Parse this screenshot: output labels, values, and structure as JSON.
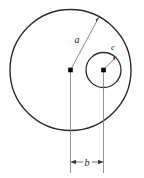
{
  "diagram": {
    "background_color": "#ffffff",
    "stroke_color": "#2b2b2b",
    "thin_stroke_color": "#555555",
    "marker_color": "#000000",
    "labels": {
      "outer_radius": "a",
      "center_offset": "b",
      "inner_radius": "c"
    },
    "shapes": {
      "outer_circle": {
        "name": "outer-circle",
        "cx": 70.5,
        "cy": 70,
        "r": 60.5
      },
      "inner_circle": {
        "name": "inner-circle",
        "cx": 103.5,
        "cy": 70,
        "r": 17.5
      },
      "outer_center_marker": {
        "name": "outer-center-marker",
        "x": 70.5,
        "y": 70
      },
      "inner_center_marker": {
        "name": "inner-center-marker",
        "x": 103.5,
        "y": 70
      }
    },
    "leaders": {
      "radius_a": {
        "x1": 70.5,
        "y1": 70,
        "x2": 99,
        "y2": 17
      },
      "radius_c": {
        "x1": 103.5,
        "y1": 70,
        "x2": 116.5,
        "y2": 56.5
      }
    },
    "extension_lines": {
      "left": {
        "x": 70.5,
        "y1": 70,
        "y2": 173
      },
      "right": {
        "x": 103.5,
        "y1": 70,
        "y2": 173
      }
    },
    "dimension_line": {
      "name": "dimension-b",
      "y": 162,
      "x1": 70.5,
      "x2": 103.5
    },
    "label_positions": {
      "a": {
        "x": 77,
        "y": 43
      },
      "c": {
        "x": 113,
        "y": 50
      },
      "b": {
        "x": 87,
        "y": 165
      }
    }
  }
}
